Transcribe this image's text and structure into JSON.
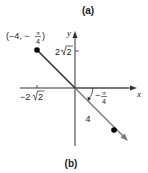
{
  "labels": {
    "part_a": "(a)",
    "part_b": "(b)",
    "x_axis": "x",
    "y_axis": "y",
    "y_tick": "2",
    "y_tick_root": "2",
    "x_tick_neg": "−2",
    "x_tick_root": "2",
    "point_label_prefix": "(−4, −",
    "point_label_pi": "π",
    "point_label_den": "4",
    "point_label_suffix": ")",
    "radius_label": "4",
    "angle_label_sign": "−",
    "angle_label_pi": "π",
    "angle_label_den": "4"
  },
  "colors": {
    "axis": "#222222",
    "segment": "#222222",
    "ray": "#7a7a7a",
    "point": "#000000"
  },
  "figure": {
    "points": [
      {
        "name": "polar-point",
        "polar": "(-4, -π/4)",
        "x": 37,
        "y": 50
      },
      {
        "name": "reflected-point",
        "x": 114,
        "y": 130
      }
    ],
    "origin": {
      "x": 75,
      "y": 88
    }
  }
}
